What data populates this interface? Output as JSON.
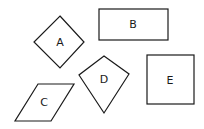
{
  "diagram": {
    "shapes": [
      {
        "id": "A",
        "label": "A",
        "kind": "diamond"
      },
      {
        "id": "B",
        "label": "B",
        "kind": "rectangle"
      },
      {
        "id": "C",
        "label": "C",
        "kind": "parallelogram"
      },
      {
        "id": "D",
        "label": "D",
        "kind": "kite"
      },
      {
        "id": "E",
        "label": "E",
        "kind": "square"
      }
    ],
    "colors": {
      "stroke": "#1a1a1a",
      "background": "#ffffff"
    }
  }
}
